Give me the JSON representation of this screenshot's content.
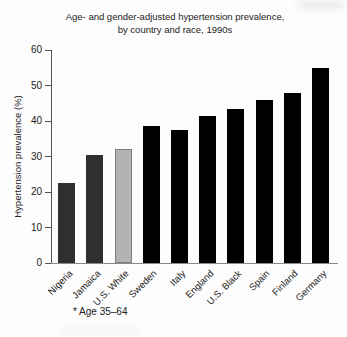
{
  "chart_data": {
    "type": "bar",
    "title_line1": "Age- and gender-adjusted hypertension prevalence,",
    "title_line2": "by country and race, 1990s",
    "ylabel": "Hypertension prevalence (%)",
    "footnote": "* Age 35–64",
    "categories": [
      "Nigeria",
      "Jamaica",
      "U.S. White",
      "Sweden",
      "Italy",
      "England",
      "U.S. Black",
      "Spain",
      "Finland",
      "Germany"
    ],
    "values": [
      22.5,
      30.5,
      32,
      38.5,
      37.5,
      41.5,
      43.5,
      46,
      48,
      55
    ],
    "bar_colors": [
      "#303030",
      "#303030",
      "#b3b3b3",
      "#000000",
      "#000000",
      "#000000",
      "#000000",
      "#000000",
      "#000000",
      "#000000"
    ],
    "bar_borders": [
      "none",
      "none",
      "#7d7d7d",
      "none",
      "none",
      "none",
      "none",
      "none",
      "none",
      "none"
    ],
    "xlabel": "",
    "ylim": [
      0,
      60
    ],
    "yticks": [
      0,
      10,
      20,
      30,
      40,
      50,
      60
    ],
    "grid": false,
    "legend_position": "none",
    "axis_color": "#555555",
    "baseline_color": "#8a8a8a"
  }
}
